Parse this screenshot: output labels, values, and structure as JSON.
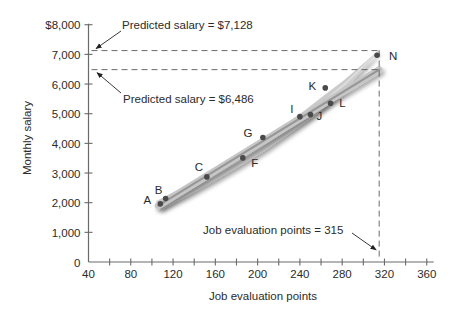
{
  "chart_data": {
    "type": "scatter",
    "title": "",
    "xlabel": "Job evaluation points",
    "ylabel": "Monthly salary",
    "xlim": [
      40,
      360
    ],
    "ylim": [
      0,
      8000
    ],
    "grid": false,
    "legend": null,
    "x_ticks": {
      "major": [
        40,
        80,
        120,
        160,
        200,
        240,
        280,
        320,
        360
      ],
      "labels": [
        "40",
        "80",
        "120",
        "160",
        "200",
        "240",
        "280",
        "320",
        "360"
      ],
      "minor_step": 20
    },
    "y_ticks": {
      "values": [
        0,
        1000,
        2000,
        3000,
        4000,
        5000,
        6000,
        7000,
        8000
      ],
      "labels": [
        "0",
        "1,000",
        "2,000",
        "3,000",
        "4,000",
        "5,000",
        "6,000",
        "7,000",
        "$8,000"
      ]
    },
    "series": [
      {
        "name": "Jobs",
        "type": "scatter",
        "color": "#4a4a4a",
        "points": [
          {
            "label": "A",
            "x": 108,
            "y": 1960,
            "label_dx": -13,
            "label_dy": -4
          },
          {
            "label": "B",
            "x": 113,
            "y": 2140,
            "label_dx": -7,
            "label_dy": -9
          },
          {
            "label": "C",
            "x": 152,
            "y": 2870,
            "label_dx": -8,
            "label_dy": -10
          },
          {
            "label": "F",
            "x": 186,
            "y": 3510,
            "label_dx": 12,
            "label_dy": 5
          },
          {
            "label": "G",
            "x": 205,
            "y": 4200,
            "label_dx": -15,
            "label_dy": -4
          },
          {
            "label": "I",
            "x": 240,
            "y": 4900,
            "label_dx": -8,
            "label_dy": -8
          },
          {
            "label": "J",
            "x": 250,
            "y": 4970,
            "label_dx": 9,
            "label_dy": 1
          },
          {
            "label": "K",
            "x": 264,
            "y": 5870,
            "label_dx": -13,
            "label_dy": -2
          },
          {
            "label": "L",
            "x": 269,
            "y": 5350,
            "label_dx": 12,
            "label_dy": 0
          },
          {
            "label": "N",
            "x": 313,
            "y": 6970,
            "label_dx": 16,
            "label_dy": 1
          }
        ]
      },
      {
        "name": "Straight-line fit",
        "type": "line",
        "color": "#979797",
        "x": [
          106,
          315
        ],
        "y": [
          1900,
          6486
        ]
      },
      {
        "name": "Curvilinear fit",
        "type": "line",
        "color": "#cbcbcb",
        "x": [
          106,
          132,
          157,
          181,
          204,
          225,
          246,
          265,
          283,
          299,
          315
        ],
        "y": [
          1900,
          2384,
          2877,
          3379,
          3888,
          4407,
          4934,
          5470,
          6014,
          6567,
          7128
        ]
      }
    ],
    "annotations": [
      {
        "text": "Predicted salary = $7,128",
        "axis": "y",
        "value": 7128
      },
      {
        "text": "Predicted salary = $6,486",
        "axis": "y",
        "value": 6486
      },
      {
        "text": "Job evaluation points = 315",
        "axis": "x",
        "value": 315
      }
    ]
  }
}
